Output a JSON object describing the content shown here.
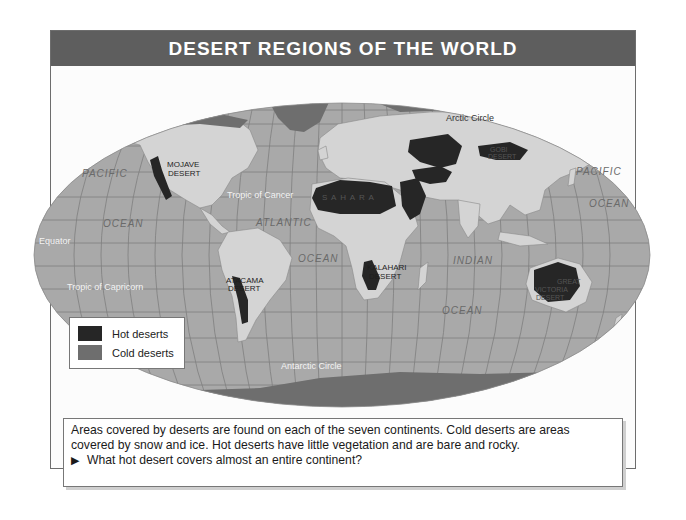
{
  "header": {
    "title": "DESERT REGIONS OF THE WORLD"
  },
  "colors": {
    "header_bg": "#5e5e5e",
    "ocean": "#a9a9a9",
    "land": "#d4d4d4",
    "hot_desert": "#262626",
    "cold_desert": "#6e6e6e",
    "gridline": "#7f7f7f"
  },
  "map": {
    "oceans": [
      {
        "label": "PACIFIC",
        "x": 110,
        "y": 177
      },
      {
        "label": "OCEAN",
        "x": 124,
        "y": 227
      },
      {
        "label": "ATLANTIC",
        "x": 283,
        "y": 226
      },
      {
        "label": "OCEAN",
        "x": 318,
        "y": 262
      },
      {
        "label": "INDIAN",
        "x": 471,
        "y": 263
      },
      {
        "label": "OCEAN",
        "x": 462,
        "y": 314
      },
      {
        "label": "PACIFIC",
        "x": 597,
        "y": 175
      },
      {
        "label": "OCEAN",
        "x": 608,
        "y": 207
      }
    ],
    "reference_lines": [
      {
        "label": "Arctic Circle",
        "x": 447,
        "y": 117
      },
      {
        "label": "Tropic of Cancer",
        "x": 262,
        "y": 196
      },
      {
        "label": "Equator",
        "x": 55,
        "y": 243
      },
      {
        "label": "Tropic of Capricorn",
        "x": 115,
        "y": 289
      },
      {
        "label": "Antarctic Circle",
        "x": 316,
        "y": 369
      }
    ],
    "deserts": [
      {
        "label": "MOJAVE",
        "label2": "DESERT",
        "x": 167,
        "y": 166,
        "type": "hot"
      },
      {
        "label": "S A H A R A",
        "label2": "",
        "x": 348,
        "y": 199,
        "type": "hot"
      },
      {
        "label": "GOBI",
        "label2": "DESERT",
        "x": 503,
        "y": 153,
        "type": "hot"
      },
      {
        "label": "KALAHARI",
        "label2": "DESERT",
        "x": 386,
        "y": 271,
        "type": "hot"
      },
      {
        "label": "ATACAMA",
        "label2": "DESERT",
        "x": 268,
        "y": 282,
        "type": "hot"
      },
      {
        "label": "GREAT",
        "label2": "VICTORIA",
        "label3": "DESERT",
        "x": 552,
        "y": 283,
        "type": "hot"
      }
    ]
  },
  "legend": {
    "items": [
      {
        "label": "Hot deserts",
        "color": "#262626"
      },
      {
        "label": "Cold deserts",
        "color": "#6e6e6e"
      }
    ]
  },
  "caption": {
    "text": "Areas covered by deserts are found on each of the seven continents. Cold deserts are areas covered by snow and ice. Hot deserts have little vegetation and are bare and rocky.",
    "question_marker": "▶",
    "question": "What hot desert covers almost an entire continent?"
  }
}
